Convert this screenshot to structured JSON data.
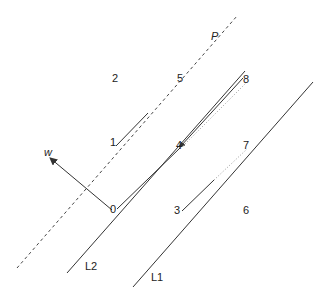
{
  "diagram": {
    "type": "geometric-lines",
    "lines": [
      {
        "id": "P",
        "label": "P",
        "style": "dashed"
      },
      {
        "id": "L2",
        "label": "L2",
        "style": "solid"
      },
      {
        "id": "L1",
        "label": "L1",
        "style": "solid"
      }
    ],
    "vector": {
      "label": "w"
    },
    "points": [
      "0",
      "1",
      "2",
      "3",
      "4",
      "5",
      "6",
      "7",
      "8"
    ]
  },
  "labels": {
    "P": "P",
    "w": "w",
    "L1": "L1",
    "L2": "L2",
    "p0": "0",
    "p1": "1",
    "p2": "2",
    "p3": "3",
    "p4": "4",
    "p5": "5",
    "p6": "6",
    "p7": "7",
    "p8": "8"
  },
  "colors": {
    "stroke": "#333333",
    "dotted": "#888888",
    "background": "#ffffff"
  }
}
